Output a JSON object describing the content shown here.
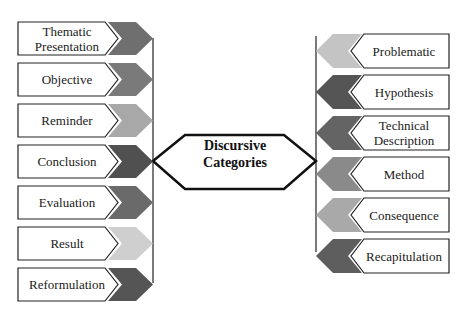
{
  "center": {
    "line1": "Discursive",
    "line2": "Categories"
  },
  "left_items": [
    {
      "line1": "Thematic",
      "line2": "Presentation",
      "color": "#6f6f6f"
    },
    {
      "line1": "Objective",
      "line2": "",
      "color": "#7a7a7a"
    },
    {
      "line1": "Reminder",
      "line2": "",
      "color": "#a8a8a8"
    },
    {
      "line1": "Conclusion",
      "line2": "",
      "color": "#505050"
    },
    {
      "line1": "Evaluation",
      "line2": "",
      "color": "#6a6a6a"
    },
    {
      "line1": "Result",
      "line2": "",
      "color": "#cfcfcf"
    },
    {
      "line1": "Reformulation",
      "line2": "",
      "color": "#555555"
    }
  ],
  "right_items": [
    {
      "line1": "Problematic",
      "line2": "",
      "color": "#c4c4c4"
    },
    {
      "line1": "Hypothesis",
      "line2": "",
      "color": "#555555"
    },
    {
      "line1": "Technical",
      "line2": "Description",
      "color": "#646464"
    },
    {
      "line1": "Method",
      "line2": "",
      "color": "#8a8a8a"
    },
    {
      "line1": "Consequence",
      "line2": "",
      "color": "#a9a9a9"
    },
    {
      "line1": "Recapitulation",
      "line2": "",
      "color": "#5e5e5e"
    }
  ]
}
